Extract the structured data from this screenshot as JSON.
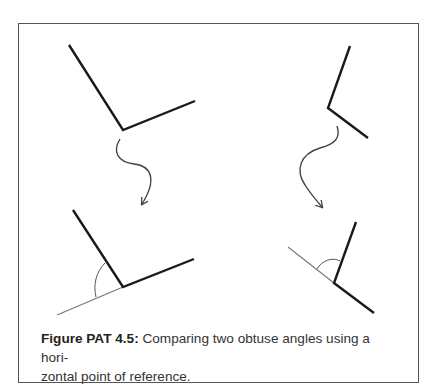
{
  "figure": {
    "caption_label": "Figure PAT 4.5:",
    "caption_text": " Comparing two obtuse angles using a hori-zontal point of reference.",
    "caption_line1": " Comparing two obtuse angles using a hori-",
    "caption_line2": "zontal point of reference.",
    "colors": {
      "border": "#555555",
      "stroke": "#1a1a1a",
      "reference_line": "#777777",
      "arrow": "#444444"
    },
    "panels": [
      {
        "position": "top-left",
        "description": "obtuse angle",
        "rays": [
          [
            69,
            45
          ],
          [
            123,
            130
          ],
          [
            195,
            101
          ]
        ]
      },
      {
        "position": "top-right",
        "description": "obtuse angle",
        "rays": [
          [
            350,
            46
          ],
          [
            328,
            108
          ],
          [
            368,
            138
          ]
        ]
      },
      {
        "position": "bottom-left",
        "description": "angle with horizontal reference line and arc",
        "rays": [
          [
            73,
            210
          ],
          [
            123,
            287
          ],
          [
            194,
            259
          ]
        ],
        "reference": [
          [
            57,
            315
          ],
          [
            123,
            287
          ]
        ]
      },
      {
        "position": "bottom-right",
        "description": "angle with horizontal reference line and arc",
        "rays": [
          [
            356,
            222
          ],
          [
            334,
            283
          ],
          [
            374,
            313
          ]
        ],
        "reference": [
          [
            288,
            247
          ],
          [
            334,
            283
          ]
        ]
      }
    ]
  }
}
